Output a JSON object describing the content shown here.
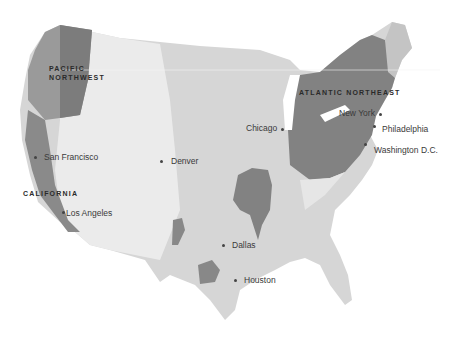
{
  "map": {
    "title": "",
    "colors": {
      "land": "#d9d9d9",
      "mountains": "#ececec",
      "highlight_region": "#7f7f7f",
      "mid_region": "#a8a8a8",
      "water": "#ffffff",
      "text": "#3a3a3a"
    },
    "regions": [
      {
        "id": "pacific-northwest",
        "label": "PACIFIC\nNORTHWEST"
      },
      {
        "id": "california",
        "label": "CALIFORNIA"
      },
      {
        "id": "atlantic-northeast",
        "label": "ATLANTIC NORTHEAST"
      }
    ],
    "cities": [
      {
        "name": "San Francisco"
      },
      {
        "name": "Los Angeles"
      },
      {
        "name": "Denver"
      },
      {
        "name": "Dallas"
      },
      {
        "name": "Houston"
      },
      {
        "name": "Chicago"
      },
      {
        "name": "New York"
      },
      {
        "name": "Philadelphia"
      },
      {
        "name": "Washington D.C."
      }
    ]
  }
}
